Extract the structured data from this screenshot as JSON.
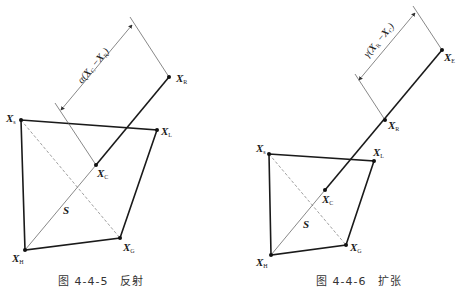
{
  "figures": [
    {
      "id": "reflection",
      "caption": "图 4-4-5　反射",
      "dimension_label": "α(XC − XR)",
      "dimension_text": {
        "prefix": "α(",
        "X1": "X",
        "s1": "C",
        "minus": "−",
        "X2": "X",
        "s2": "R",
        "suffix": ")"
      },
      "region_label": "S",
      "points": [
        {
          "name": "X",
          "sub": "s",
          "x": 21,
          "y": 120
        },
        {
          "name": "X",
          "sub": "L",
          "x": 157,
          "y": 130
        },
        {
          "name": "X",
          "sub": "R",
          "x": 169,
          "y": 77
        },
        {
          "name": "X",
          "sub": "C",
          "x": 96,
          "y": 165
        },
        {
          "name": "X",
          "sub": "G",
          "x": 120,
          "y": 238
        },
        {
          "name": "X",
          "sub": "H",
          "x": 25,
          "y": 250
        }
      ]
    },
    {
      "id": "expansion",
      "caption": "图 4-4-6　扩张",
      "dimension_label": "γ(XR − XC)",
      "dimension_text": {
        "prefix": "γ(",
        "X1": "X",
        "s1": "R",
        "minus": "−",
        "X2": "X",
        "s2": "C",
        "suffix": ")"
      },
      "region_label": "S",
      "points": [
        {
          "name": "X",
          "sub": "s",
          "x": 269,
          "y": 154
        },
        {
          "name": "X",
          "sub": "L",
          "x": 374,
          "y": 161
        },
        {
          "name": "X",
          "sub": "E",
          "x": 442,
          "y": 50
        },
        {
          "name": "X",
          "sub": "R",
          "x": 385,
          "y": 120
        },
        {
          "name": "X",
          "sub": "C",
          "x": 325,
          "y": 190
        },
        {
          "name": "X",
          "sub": "G",
          "x": 346,
          "y": 245
        },
        {
          "name": "X",
          "sub": "H",
          "x": 271,
          "y": 255
        }
      ]
    }
  ]
}
